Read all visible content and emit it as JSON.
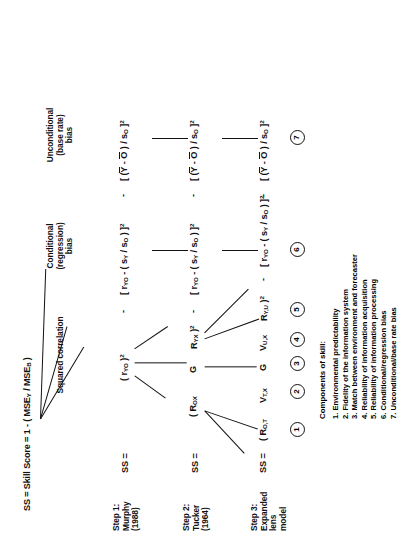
{
  "figure": {
    "title": "SS = Skill Score = 1 - ( MSE",
    "title_full": "SS = Skill Score = 1 - ( MSEY / MSEB )",
    "title_parts": {
      "lead": "SS = Skill Score = 1 - ( MSE",
      "sub1": "Y",
      "mid": " / MSE",
      "sub2": "B",
      "tail": " )"
    },
    "column_headers": [
      {
        "name": "squared-correlation",
        "lines": [
          "Squared correlation"
        ]
      },
      {
        "name": "conditional-bias",
        "lines": [
          "Conditional",
          "(regression)",
          "bias"
        ]
      },
      {
        "name": "unconditional-bias",
        "lines": [
          "Unconditional",
          "(base rate)",
          "bias"
        ]
      }
    ],
    "steps": [
      {
        "id": "step1",
        "lines": [
          "Step 1:",
          "Murphy",
          "(1988)"
        ],
        "ss_label": "SS ="
      },
      {
        "id": "step2",
        "lines": [
          "Step 2:",
          "Tucker",
          "(1964)"
        ],
        "ss_label": "SS ="
      },
      {
        "id": "step3",
        "lines": [
          "Step 3:",
          "Expanded",
          "lens",
          "model"
        ],
        "ss_label": "SS ="
      }
    ],
    "rows": {
      "row1": {
        "term1": {
          "lead": "( r",
          "sub": "YO",
          "close": " )",
          "sup": "2"
        },
        "minus_a": "-",
        "term2": {
          "open": "[ r",
          "sub1": "YO",
          "mid": " - ( s",
          "sub2": "Y",
          "slash": " / s",
          "sub3": "O",
          "close": " ) ]",
          "sup": "2"
        },
        "minus_b": "-",
        "term3": {
          "open": "[ (",
          "bar1": "Y",
          "dash": " - ",
          "bar2": "O",
          "close_paren": " )",
          "slash": " / s",
          "sub": "O",
          "close": " ]",
          "sup": "2"
        }
      },
      "row2": {
        "term1_a": {
          "lead": "( R",
          "sub": "OX"
        },
        "term1_b": {
          "lead": "G"
        },
        "term1_c": {
          "lead": "R",
          "sub": "YX",
          "close": " )",
          "sup": "2"
        },
        "minus_a": "-",
        "term2": {
          "open": "[ r",
          "sub1": "YO",
          "mid": " - ( s",
          "sub2": "Y",
          "slash": " / s",
          "sub3": "O",
          "close": " ) ]",
          "sup": "2"
        },
        "minus_b": "-",
        "term3": {
          "open": "[ (",
          "bar1": "Y",
          "dash": " - ",
          "bar2": "O",
          "close_paren": " )",
          "slash": " / s",
          "sub": "O",
          "close": " ]",
          "sup": "2"
        }
      },
      "row3": {
        "t1": {
          "lead": "( R",
          "sub": "O,T"
        },
        "t2": {
          "lead": "V",
          "sub": "T,X"
        },
        "t3": {
          "lead": "G"
        },
        "t4": {
          "lead": "V",
          "sub": "U,X"
        },
        "t5": {
          "lead": "R",
          "sub": "Y,U",
          "close": " )",
          "sup": "2"
        },
        "minus_a": "-",
        "term2": {
          "open": "[ r",
          "sub1": "YO",
          "mid": " - ( s",
          "sub2": "Y",
          "slash": " / s",
          "sub3": "O",
          "close": " ) ]",
          "sup": "2"
        },
        "minus_b": "-",
        "term3": {
          "open": "[ (",
          "bar1": "Y",
          "dash": " - ",
          "bar2": "O",
          "close_paren": " )",
          "slash": " / s",
          "sub": "O",
          "close": " ]",
          "sup": "2"
        }
      }
    },
    "component_numbers": [
      "1",
      "2",
      "3",
      "4",
      "5",
      "6",
      "7"
    ],
    "legend": {
      "title": "Components of skill:",
      "items": [
        "1. Environmental predictability",
        "2. Fidelity of the information system",
        "3. Match between environment and forecaster",
        "4. Reliability of information acquisition",
        "5. Reliability of information processing",
        "6. Conditional/regression bias",
        "7. Unconditional/base rate bias"
      ]
    },
    "colors": {
      "ink": "#111111",
      "paper": "#ffffff"
    }
  }
}
